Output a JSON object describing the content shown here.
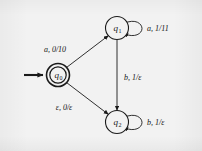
{
  "figure": {
    "type": "finite-state-transducer-diagram",
    "background_color": "#f2f2f2",
    "ink_color": "#1a1a1a",
    "states": [
      {
        "id": "q0",
        "label": "q",
        "subscript": "0",
        "shape": "double-circle",
        "is_start": true,
        "is_accepting": true,
        "x": 58,
        "y": 75
      },
      {
        "id": "q1",
        "label": "q",
        "subscript": "1",
        "shape": "circle",
        "is_start": false,
        "is_accepting": false,
        "x": 117,
        "y": 28
      },
      {
        "id": "q2",
        "label": "q",
        "subscript": "2",
        "shape": "circle",
        "is_start": false,
        "is_accepting": false,
        "x": 117,
        "y": 122
      }
    ],
    "start_arrow": {
      "from_x": 24,
      "to_x": 44,
      "y": 75
    },
    "transitions": [
      {
        "id": "t-q0-q1",
        "from": "q0",
        "to": "q1",
        "label": "a, 0/10",
        "kind": "straight",
        "label_x": 70,
        "label_y": 49
      },
      {
        "id": "t-q0-q2",
        "from": "q0",
        "to": "q2",
        "label": "ε, 0/ε",
        "kind": "straight",
        "label_x": 66,
        "label_y": 108
      },
      {
        "id": "t-q1-q2",
        "from": "q1",
        "to": "q2",
        "label": "b, 1/ε",
        "kind": "straight",
        "label_x": 122,
        "label_y": 78
      },
      {
        "id": "t-q1-q1",
        "from": "q1",
        "to": "q1",
        "label": "a, 1/11",
        "kind": "self-loop",
        "label_x": 152,
        "label_y": 31
      },
      {
        "id": "t-q2-q2",
        "from": "q2",
        "to": "q2",
        "label": "b, 1/ε",
        "kind": "self-loop",
        "label_x": 152,
        "label_y": 125
      }
    ]
  }
}
